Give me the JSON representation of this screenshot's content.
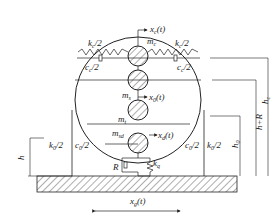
{
  "diagram": {
    "type": "mechanical-model",
    "masses": [
      {
        "id": "m_c",
        "label": "m",
        "sub": "c"
      },
      {
        "id": "m_s",
        "label": "m",
        "sub": "s"
      },
      {
        "id": "m_t",
        "label": "m",
        "sub": "t"
      },
      {
        "id": "m_sd",
        "label": "m",
        "sub": "sd"
      }
    ],
    "springs": [
      {
        "id": "kc_left",
        "label": "k",
        "sub": "c",
        "suffix": "/2"
      },
      {
        "id": "kc_right",
        "label": "k",
        "sub": "c",
        "suffix": "/2"
      },
      {
        "id": "k0_left",
        "label": "k",
        "sub": "0",
        "suffix": "/2"
      },
      {
        "id": "k0_right",
        "label": "k",
        "sub": "0",
        "suffix": "/2"
      },
      {
        "id": "kq",
        "label": "k",
        "sub": "q",
        "suffix": ""
      }
    ],
    "dampers": [
      {
        "id": "cc_left",
        "label": "c",
        "sub": "c",
        "suffix": "/2"
      },
      {
        "id": "cc_right",
        "label": "c",
        "sub": "c",
        "suffix": "/2"
      },
      {
        "id": "c0_left",
        "label": "c",
        "sub": "0",
        "suffix": "/2"
      },
      {
        "id": "c0_right",
        "label": "c",
        "sub": "0",
        "suffix": "/2"
      },
      {
        "id": "R",
        "label": "R",
        "sub": "",
        "suffix": ""
      }
    ],
    "displacements": [
      {
        "id": "xc",
        "label": "x",
        "sub": "c",
        "suffix": "(t)"
      },
      {
        "id": "x0",
        "label": "x",
        "sub": "0",
        "suffix": "(t)"
      },
      {
        "id": "xd",
        "label": "x",
        "sub": "d",
        "suffix": "(t)"
      },
      {
        "id": "xg",
        "label": "x",
        "sub": "g",
        "suffix": "(t)"
      }
    ],
    "heights": [
      {
        "id": "h",
        "label": "h",
        "sub": ""
      },
      {
        "id": "h0",
        "label": "h",
        "sub": "0"
      },
      {
        "id": "hR",
        "label": "h+R",
        "sub": ""
      },
      {
        "id": "hc",
        "label": "h",
        "sub": "c"
      }
    ]
  }
}
